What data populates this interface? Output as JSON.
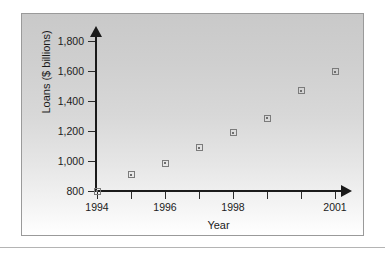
{
  "figure": {
    "frame_border_color": "#9a9a9a",
    "background_top_color": "#c9c9c9",
    "background_bottom_color": "#ffffff",
    "axis_color": "#1a1a1a",
    "marker_color": "#7b7b7b"
  },
  "chart_data": {
    "type": "scatter",
    "title": "",
    "xlabel": "Year",
    "ylabel": "Loans ($ billions)",
    "x": [
      1994,
      1995,
      1996,
      1997,
      1998,
      1999,
      2000,
      2001
    ],
    "values": [
      800,
      910,
      985,
      1090,
      1190,
      1285,
      1470,
      1595
    ],
    "xlim": [
      1994,
      2001
    ],
    "ylim": [
      800,
      1800
    ],
    "x_ticks": [
      1994,
      1995,
      1996,
      1997,
      1998,
      1999,
      2000,
      2001
    ],
    "x_tick_labels": [
      "1994",
      "",
      "1996",
      "",
      "1998",
      "",
      "",
      "2001"
    ],
    "y_ticks": [
      800,
      1000,
      1200,
      1400,
      1600,
      1800
    ],
    "y_tick_labels": [
      "800",
      "1,000",
      "1,200",
      "1,400",
      "1,600",
      "1,800"
    ],
    "grid": false,
    "legend": false,
    "marker": "open-square-with-dot"
  }
}
